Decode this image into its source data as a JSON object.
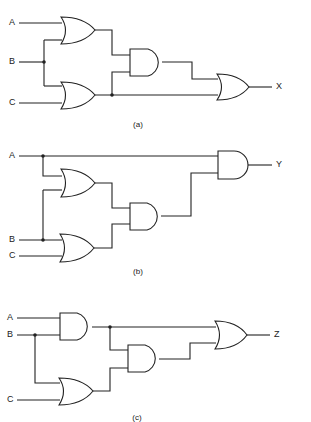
{
  "diagrams": [
    {
      "id": "a",
      "caption": "(a)",
      "inputs": [
        "A",
        "B",
        "C"
      ],
      "output": "X",
      "gates": [
        "OR(A,B)",
        "OR(B,C)",
        "AND(OR1,OR2)",
        "OR(AND,OR2)"
      ],
      "expression": "X = (A+B)(B+C) + (B+C)"
    },
    {
      "id": "b",
      "caption": "(b)",
      "inputs": [
        "A",
        "B",
        "C"
      ],
      "output": "Y",
      "gates": [
        "OR(A,B)",
        "OR(B,C)",
        "AND(OR1,OR2)",
        "AND(A,AND)"
      ],
      "expression": "Y = A(A+B)(B+C)"
    },
    {
      "id": "c",
      "caption": "(c)",
      "inputs": [
        "A",
        "B",
        "C"
      ],
      "output": "Z",
      "gates": [
        "AND(A,B)",
        "OR(B,C)",
        "AND(AND1,OR)",
        "OR(AND1,AND2)"
      ],
      "expression": "Z = AB + AB(B+C)"
    }
  ],
  "colors": {
    "line": "#222222",
    "background": "#ffffff"
  }
}
